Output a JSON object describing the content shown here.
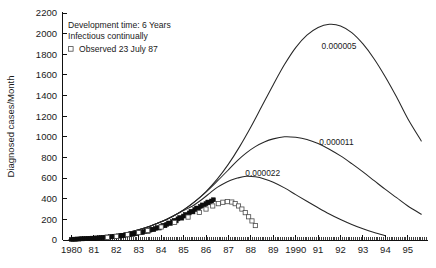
{
  "chart_data": {
    "type": "line",
    "title": "",
    "xlabel": "",
    "ylabel": "Diagnosed cases/Month",
    "xlim": [
      1979.6,
      1995.9
    ],
    "ylim": [
      0,
      2200
    ],
    "grid": false,
    "legend_position": "upper-left-inset",
    "y_ticks": [
      0,
      200,
      400,
      600,
      800,
      1000,
      1200,
      1400,
      1600,
      1800,
      2000,
      2200
    ],
    "y_tick_labels": [
      "0",
      "200",
      "400",
      "600",
      "800",
      "1000",
      "1200",
      "1400",
      "1600",
      "1800",
      "2000",
      "2200"
    ],
    "x_ticks": [
      1980,
      1981,
      1982,
      1983,
      1984,
      1985,
      1986,
      1987,
      1988,
      1989,
      1990,
      1991,
      1992,
      1993,
      1994,
      1995
    ],
    "x_tick_labels": [
      "1980",
      "81",
      "82",
      "83",
      "84",
      "85",
      "86",
      "87",
      "88",
      "89",
      "1990",
      "91",
      "92",
      "93",
      "94",
      "95"
    ],
    "x_minor_tick_interval": 0.0833,
    "annotations": [
      "Development time: 6 Years",
      "Infectious continually"
    ],
    "series": [
      {
        "name": "0.000005",
        "label": "0.000005",
        "label_x": 1991.15,
        "label_y": 1880,
        "type": "line",
        "color": "#262626",
        "x": [
          1979.9,
          1980.5,
          1981.0,
          1981.5,
          1982.0,
          1982.5,
          1983.0,
          1983.5,
          1984.0,
          1984.5,
          1985.0,
          1985.5,
          1986.0,
          1986.5,
          1987.0,
          1987.5,
          1988.0,
          1988.5,
          1989.0,
          1989.5,
          1990.0,
          1990.5,
          1991.0,
          1991.5,
          1992.0,
          1992.5,
          1993.0,
          1993.5,
          1994.0,
          1994.5,
          1995.0,
          1995.6
        ],
        "y": [
          8,
          14,
          22,
          34,
          50,
          72,
          100,
          134,
          176,
          228,
          292,
          372,
          470,
          590,
          735,
          905,
          1095,
          1300,
          1505,
          1700,
          1865,
          1985,
          2060,
          2090,
          2075,
          2010,
          1900,
          1755,
          1580,
          1385,
          1175,
          960
        ]
      },
      {
        "name": "0.000011",
        "label": "0.000011",
        "label_x": 1991.05,
        "label_y": 950,
        "type": "line",
        "color": "#262626",
        "x": [
          1979.9,
          1980.5,
          1981.0,
          1981.5,
          1982.0,
          1982.5,
          1983.0,
          1983.5,
          1984.0,
          1984.5,
          1985.0,
          1985.5,
          1986.0,
          1986.5,
          1987.0,
          1987.4,
          1987.8,
          1988.2,
          1988.6,
          1989.0,
          1989.5,
          1990.0,
          1990.5,
          1991.0,
          1991.5,
          1992.0,
          1992.5,
          1993.0,
          1993.5,
          1994.0,
          1994.5,
          1995.0,
          1995.6
        ],
        "y": [
          8,
          14,
          22,
          34,
          50,
          72,
          100,
          134,
          176,
          228,
          292,
          372,
          465,
          570,
          680,
          770,
          845,
          905,
          950,
          980,
          1000,
          995,
          975,
          935,
          880,
          815,
          740,
          660,
          575,
          490,
          410,
          330,
          250
        ]
      },
      {
        "name": "0.000022",
        "label": "0.000022",
        "label_x": 1987.75,
        "label_y": 650,
        "type": "line",
        "color": "#262626",
        "x": [
          1979.9,
          1980.5,
          1981.0,
          1981.5,
          1982.0,
          1982.5,
          1983.0,
          1983.5,
          1984.0,
          1984.5,
          1985.0,
          1985.4,
          1985.8,
          1986.2,
          1986.5,
          1986.8,
          1987.1,
          1987.4,
          1987.8,
          1988.2,
          1988.6,
          1989.0,
          1989.5,
          1990.0,
          1990.5,
          1991.0,
          1991.5,
          1992.0,
          1992.5,
          1993.0,
          1993.5,
          1994.0
        ],
        "y": [
          8,
          14,
          22,
          34,
          50,
          72,
          100,
          134,
          176,
          228,
          285,
          330,
          390,
          460,
          510,
          548,
          578,
          600,
          618,
          612,
          592,
          560,
          505,
          440,
          375,
          312,
          252,
          198,
          150,
          108,
          72,
          42
        ]
      },
      {
        "name": "Observed 23 July 87",
        "label": "Observed 23 July 87",
        "type": "scatter",
        "marker": "filled-square",
        "color": "#0d0d0d",
        "x": [
          1980.0,
          1980.08,
          1980.17,
          1980.25,
          1980.33,
          1980.42,
          1980.5,
          1980.58,
          1980.67,
          1980.75,
          1980.83,
          1980.92,
          1981.0,
          1981.08,
          1981.17,
          1981.25,
          1981.33,
          1981.42,
          1981.5,
          1981.58,
          1981.67,
          1981.75,
          1981.83,
          1981.92,
          1982.0,
          1982.08,
          1982.17,
          1982.25,
          1982.33,
          1982.42,
          1982.5,
          1982.58,
          1982.67,
          1982.75,
          1982.83,
          1982.92,
          1983.0,
          1983.08,
          1983.17,
          1983.25,
          1983.33,
          1983.42,
          1983.5,
          1983.58,
          1983.67,
          1983.75,
          1983.83,
          1983.92,
          1984.0,
          1984.08,
          1984.17,
          1984.25,
          1984.33,
          1984.42,
          1984.5,
          1984.58,
          1984.67,
          1984.75,
          1984.83,
          1984.92,
          1985.0,
          1985.08,
          1985.17,
          1985.25,
          1985.33,
          1985.42,
          1985.5,
          1985.58,
          1985.67,
          1985.75,
          1985.83,
          1985.92,
          1986.0,
          1986.08,
          1986.17,
          1986.25,
          1986.33
        ],
        "y": [
          6,
          8,
          7,
          10,
          9,
          12,
          11,
          14,
          13,
          16,
          15,
          18,
          17,
          20,
          19,
          23,
          22,
          26,
          25,
          29,
          28,
          33,
          31,
          36,
          35,
          40,
          38,
          44,
          42,
          48,
          52,
          50,
          58,
          56,
          64,
          62,
          70,
          75,
          72,
          82,
          88,
          85,
          96,
          104,
          100,
          112,
          120,
          116,
          130,
          142,
          138,
          152,
          165,
          160,
          178,
          190,
          185,
          205,
          218,
          212,
          232,
          248,
          240,
          262,
          278,
          272,
          295,
          310,
          302,
          325,
          340,
          332,
          352,
          368,
          360,
          378,
          390
        ]
      },
      {
        "name": "Observed adjusted",
        "label": "",
        "type": "scatter",
        "marker": "open-square",
        "color": "#4a4a4a",
        "x": [
          1981.6,
          1982.0,
          1982.5,
          1983.0,
          1983.4,
          1984.0,
          1984.6,
          1985.2,
          1985.7,
          1986.0,
          1986.3,
          1986.55,
          1986.75,
          1986.95,
          1987.15,
          1987.3,
          1987.45,
          1987.6,
          1987.75,
          1987.9,
          1988.05,
          1988.2
        ],
        "y": [
          26,
          36,
          52,
          72,
          92,
          126,
          170,
          222,
          268,
          300,
          330,
          352,
          366,
          372,
          368,
          352,
          330,
          300,
          265,
          225,
          185,
          140
        ]
      }
    ]
  },
  "legend": {
    "line1": "Development time: 6 Years",
    "line2": "Infectious continually",
    "line3": "Observed 23 July 87",
    "marker_name": "open-square-marker"
  },
  "axes": {
    "y_title": "Diagnosed cases/Month"
  }
}
